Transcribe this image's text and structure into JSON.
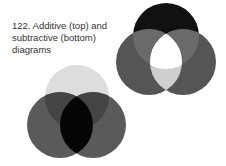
{
  "caption": {
    "line1": "122. Additive (top) and",
    "line2": "subtractive (bottom)",
    "line3": "diagrams"
  },
  "additive": {
    "circles": [
      {
        "cx": 166,
        "cy": 36,
        "r": 33,
        "color": "#111111"
      },
      {
        "cx": 149,
        "cy": 62,
        "r": 33,
        "color": "#555555"
      },
      {
        "cx": 183,
        "cy": 62,
        "r": 33,
        "color": "#555555"
      }
    ],
    "center": "#ffffff"
  },
  "subtractive": {
    "circles": [
      {
        "cx": 77,
        "cy": 97,
        "r": 32,
        "color": "#dddddd"
      },
      {
        "cx": 60,
        "cy": 125,
        "r": 33,
        "color": "#555555"
      },
      {
        "cx": 93,
        "cy": 125,
        "r": 33,
        "color": "#555555"
      }
    ],
    "center": "#000000"
  }
}
